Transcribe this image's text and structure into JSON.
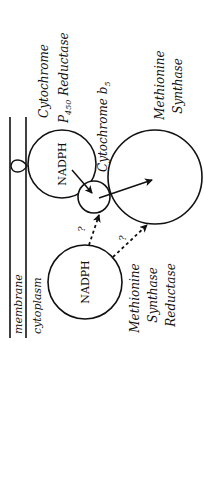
{
  "diagram": {
    "orientation": "rotated-90-ccw",
    "compartments": {
      "membrane_label": "membrane",
      "cytoplasm_label": "cytoplasm"
    },
    "proteins": [
      {
        "id": "cpr",
        "name_line1": "Cytochrome",
        "name_line2_prefix": "P",
        "name_line2_sub": "450",
        "name_line2_suffix": " Reductase",
        "cofactor": "NADPH",
        "membrane_anchored": true
      },
      {
        "id": "b5",
        "name": "Cytochrome b",
        "name_sub": "5"
      },
      {
        "id": "ms",
        "name_line1": "Methionine",
        "name_line2": "Synthase"
      },
      {
        "id": "msr",
        "name_line1": "Methionine",
        "name_line2": "Synthase",
        "name_line3": "Reductase",
        "cofactor": "NADPH"
      }
    ],
    "arrows": [
      {
        "from": "cpr",
        "to": "b5",
        "style": "solid",
        "label": ""
      },
      {
        "from": "b5",
        "to": "ms",
        "style": "solid",
        "label": ""
      },
      {
        "from": "msr",
        "to": "b5",
        "style": "dashed",
        "label": "?"
      },
      {
        "from": "msr",
        "to": "ms",
        "style": "dashed",
        "label": "?"
      }
    ],
    "colors": {
      "ink": "#111111",
      "background": "#ffffff"
    }
  }
}
